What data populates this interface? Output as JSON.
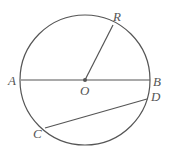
{
  "figure": {
    "circle": {
      "cx": 85,
      "cy": 80,
      "r": 65
    },
    "stroke_color": "#555555",
    "points": {
      "A": {
        "x": 21,
        "y": 80,
        "label": "A"
      },
      "B": {
        "x": 150,
        "y": 80,
        "label": "B"
      },
      "O": {
        "x": 85,
        "y": 80,
        "label": "O"
      },
      "R": {
        "x": 113,
        "y": 25,
        "label": "R"
      },
      "C": {
        "x": 45,
        "y": 128,
        "label": "C"
      },
      "D": {
        "x": 147,
        "y": 99,
        "label": "D"
      }
    },
    "segments": [
      {
        "from": "A",
        "to": "B"
      },
      {
        "from": "O",
        "to": "R"
      },
      {
        "from": "C",
        "to": "D"
      }
    ]
  }
}
